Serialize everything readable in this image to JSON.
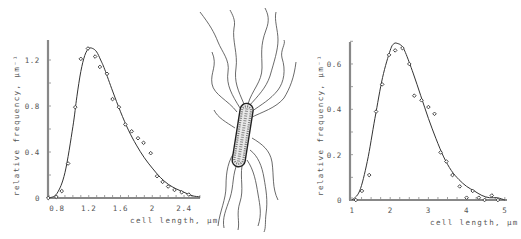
{
  "chart_data": [
    {
      "type": "scatter",
      "panel": "left",
      "title": "",
      "xlabel": "cell length, μm",
      "ylabel": "relative frequency, μm⁻¹",
      "xlim": [
        0.7,
        2.6
      ],
      "ylim": [
        0,
        1.35
      ],
      "xticks": [
        0.8,
        1.2,
        1.6,
        2,
        2.4
      ],
      "xtick_labels": [
        "0.8",
        "1.2",
        "1.6",
        "2",
        "2.4"
      ],
      "yticks": [
        0,
        0.4,
        0.8,
        1.2
      ],
      "ytick_labels": [
        "0",
        "0.4",
        "0.8",
        "1.2"
      ],
      "grid": false,
      "legend": null,
      "series": [
        {
          "name": "observed",
          "style": "open-diamond markers",
          "x": [
            0.69,
            0.79,
            0.86,
            0.94,
            1.03,
            1.1,
            1.19,
            1.28,
            1.34,
            1.43,
            1.5,
            1.58,
            1.66,
            1.74,
            1.82,
            1.89,
            1.98,
            2.06,
            2.13,
            2.2,
            2.28,
            2.37,
            2.46
          ],
          "y": [
            0.0,
            0.01,
            0.06,
            0.3,
            0.79,
            1.21,
            1.3,
            1.23,
            1.14,
            1.08,
            0.86,
            0.79,
            0.64,
            0.58,
            0.52,
            0.48,
            0.39,
            0.19,
            0.14,
            0.1,
            0.07,
            0.05,
            0.03
          ]
        },
        {
          "name": "fitted distribution",
          "style": "solid line",
          "x": [
            0.7,
            0.8,
            0.9,
            1.0,
            1.05,
            1.1,
            1.15,
            1.2,
            1.25,
            1.3,
            1.35,
            1.4,
            1.5,
            1.6,
            1.7,
            1.8,
            1.9,
            2.0,
            2.1,
            2.2,
            2.3,
            2.4,
            2.5,
            2.6
          ],
          "y": [
            0.0,
            0.04,
            0.22,
            0.62,
            0.88,
            1.1,
            1.24,
            1.3,
            1.3,
            1.27,
            1.2,
            1.12,
            0.93,
            0.75,
            0.59,
            0.46,
            0.35,
            0.26,
            0.18,
            0.12,
            0.08,
            0.05,
            0.02,
            0.01
          ]
        }
      ]
    },
    {
      "type": "scatter",
      "panel": "right",
      "title": "",
      "xlabel": "cell length, μm",
      "ylabel": "relative frequency, μm⁻¹",
      "xlim": [
        0.9,
        5
      ],
      "ylim": [
        0,
        0.7
      ],
      "xticks": [
        1,
        2,
        3,
        4,
        5
      ],
      "xtick_labels": [
        "1",
        "2",
        "3",
        "4",
        "5"
      ],
      "yticks": [
        0,
        0.2,
        0.4,
        0.6
      ],
      "ytick_labels": [
        "0",
        "0.2",
        "0.4",
        "0.6"
      ],
      "grid": false,
      "legend": null,
      "series": [
        {
          "name": "observed",
          "style": "open-diamond markers",
          "x": [
            1.1,
            1.26,
            1.45,
            1.63,
            1.79,
            1.97,
            2.13,
            2.32,
            2.5,
            2.63,
            2.82,
            3.0,
            3.16,
            3.32,
            3.47,
            3.63,
            3.82,
            4.0,
            4.16,
            4.32,
            4.47,
            4.66,
            4.82
          ],
          "y": [
            0.0,
            0.04,
            0.11,
            0.39,
            0.51,
            0.64,
            0.66,
            0.67,
            0.6,
            0.46,
            0.44,
            0.41,
            0.38,
            0.21,
            0.17,
            0.11,
            0.06,
            0.01,
            0.04,
            0.01,
            0.0,
            0.02,
            0.0
          ]
        },
        {
          "name": "fitted distribution",
          "style": "solid line",
          "x": [
            1.0,
            1.2,
            1.4,
            1.6,
            1.8,
            2.0,
            2.1,
            2.2,
            2.3,
            2.4,
            2.6,
            2.8,
            3.0,
            3.2,
            3.4,
            3.6,
            3.8,
            4.0,
            4.2,
            4.4,
            4.6,
            4.8,
            5.0
          ],
          "y": [
            0.0,
            0.04,
            0.17,
            0.36,
            0.54,
            0.66,
            0.69,
            0.69,
            0.68,
            0.65,
            0.56,
            0.46,
            0.36,
            0.27,
            0.19,
            0.13,
            0.09,
            0.06,
            0.04,
            0.02,
            0.01,
            0.01,
            0.0
          ]
        }
      ]
    }
  ],
  "left_chart": {
    "ylabel": "relative frequency, μm⁻¹",
    "xlabel": "cell length, μm",
    "xtick_labels": [
      "0.8",
      "1.2",
      "1.6",
      "2",
      "2.4"
    ],
    "ytick_labels": [
      "0",
      "0.4",
      "0.8",
      "1.2"
    ]
  },
  "right_chart": {
    "ylabel": "relative frequency, μm⁻¹",
    "xlabel": "cell length, μm",
    "xtick_labels": [
      "1",
      "2",
      "3",
      "4",
      "5"
    ],
    "ytick_labels": [
      "0",
      "0.2",
      "0.4",
      "0.6"
    ]
  },
  "illustration": {
    "subject": "flagellated rod-shaped bacterium",
    "icon": "bacterium-drawing"
  }
}
